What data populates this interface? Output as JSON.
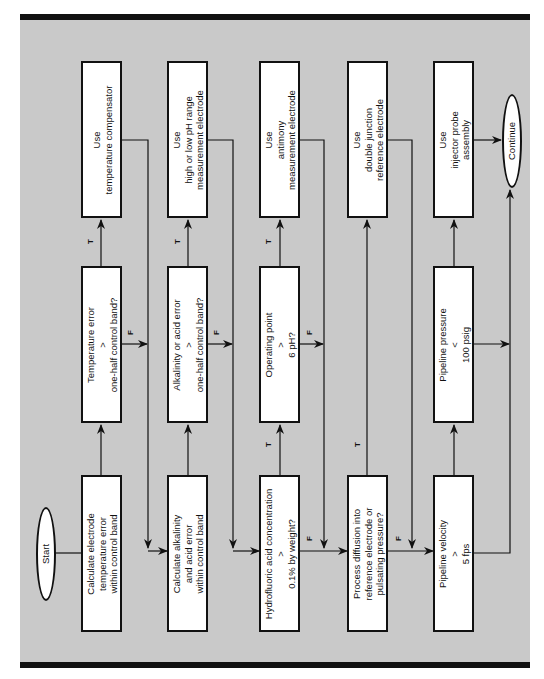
{
  "flowchart": {
    "start": "Start",
    "end": "Continue",
    "rows": [
      {
        "process": [
          "Calculate electrode",
          "temperature error",
          "within control band"
        ],
        "decision": [
          "Temperature error",
          ">",
          "one-half control band?"
        ],
        "action": [
          "Use",
          "temperature compensator"
        ]
      },
      {
        "process": [
          "Calculate alkalinity",
          "and acid error",
          "within control band"
        ],
        "decision": [
          "Alkalinity or acid error",
          ">",
          "one-half control band?"
        ],
        "action": [
          "Use",
          "high or low pH range",
          "measurement electrode"
        ]
      },
      {
        "decision1": [
          "Hydrofluoric acid concentration",
          ">",
          "0.1% by weight?"
        ],
        "decision2": [
          "Operating point",
          ">",
          "6 pH?"
        ],
        "action": [
          "Use",
          "antimony",
          "measurement electrode"
        ]
      },
      {
        "decision": [
          "Process diffusion into",
          "reference electrode or",
          "pulsating pressure?"
        ],
        "action": [
          "Use",
          "double junction",
          "reference electrode"
        ]
      },
      {
        "decision1": [
          "Pipeline velocity",
          ">",
          "5 fps"
        ],
        "decision2": [
          "Pipeline pressure",
          "<",
          "100 psig"
        ],
        "action": [
          "Use",
          "injector probe",
          "assembly"
        ]
      }
    ],
    "labels": {
      "true": "T",
      "false": "F"
    }
  },
  "colors": {
    "background": "#c9c9c9",
    "box": "#ffffff",
    "stroke": "#111111",
    "rule": "#111111"
  }
}
